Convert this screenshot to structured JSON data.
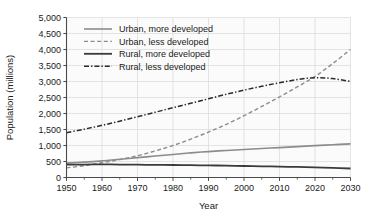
{
  "chart_data": {
    "type": "line",
    "title": "",
    "xlabel": "Year",
    "ylabel": "Population (millions)",
    "xlim": [
      1950,
      2030
    ],
    "ylim": [
      0,
      5000
    ],
    "xticks": [
      1950,
      1960,
      1970,
      1980,
      1990,
      2000,
      2010,
      2020,
      2030
    ],
    "xticklabels": [
      "1950",
      "1960",
      "1970",
      "1980",
      "1990",
      "2000",
      "2010",
      "2020",
      "2030"
    ],
    "xminor_step": 5,
    "yticks": [
      0,
      500,
      1000,
      1500,
      2000,
      2500,
      3000,
      3500,
      4000,
      4500,
      5000
    ],
    "yticklabels": [
      "0",
      "500",
      "1,000",
      "1,500",
      "2,000",
      "2,500",
      "3,000",
      "3,500",
      "4,000",
      "4,500",
      "5,000"
    ],
    "grid": true,
    "legend_position": "upper-left-inside",
    "x": [
      1950,
      1955,
      1960,
      1965,
      1970,
      1975,
      1980,
      1985,
      1990,
      1995,
      2000,
      2005,
      2010,
      2015,
      2020,
      2025,
      2030
    ],
    "series": [
      {
        "name": "Urban, more developed",
        "style": "solid",
        "color": "#8c8c8c",
        "width": 1.6,
        "values": [
          450,
          480,
          520,
          570,
          620,
          670,
          720,
          770,
          810,
          845,
          875,
          905,
          935,
          965,
          995,
          1025,
          1050
        ]
      },
      {
        "name": "Urban, less developed",
        "style": "dashed",
        "color": "#8c8c8c",
        "width": 1.4,
        "values": [
          300,
          370,
          460,
          560,
          680,
          830,
          1000,
          1200,
          1420,
          1660,
          1930,
          2220,
          2520,
          2830,
          3160,
          3560,
          4000
        ]
      },
      {
        "name": "Rural, more developed",
        "style": "solid",
        "color": "#3a3a3a",
        "width": 1.8,
        "values": [
          400,
          405,
          408,
          405,
          400,
          395,
          390,
          385,
          378,
          370,
          360,
          350,
          340,
          330,
          318,
          300,
          282
        ]
      },
      {
        "name": "Rural, less developed",
        "style": "dashdot",
        "color": "#2b2b2b",
        "width": 1.5,
        "values": [
          1400,
          1510,
          1630,
          1760,
          1900,
          2040,
          2180,
          2320,
          2460,
          2600,
          2730,
          2850,
          2960,
          3060,
          3120,
          3090,
          3000
        ]
      }
    ],
    "legend_entries": [
      {
        "label": "Urban, more developed",
        "style": "solid",
        "color": "#8c8c8c",
        "width": 1.6
      },
      {
        "label": "Urban, less developed",
        "style": "dashed",
        "color": "#8c8c8c",
        "width": 1.4
      },
      {
        "label": "Rural, more developed",
        "style": "solid",
        "color": "#3a3a3a",
        "width": 1.8
      },
      {
        "label": "Rural, less developed",
        "style": "dashdot",
        "color": "#2b2b2b",
        "width": 1.5
      }
    ],
    "colors": {
      "background": "#ffffff",
      "plot_background": "#fbfbfb",
      "grid": "#d8d8d8",
      "axis": "#4a4a4a",
      "text": "#1a1a1a"
    }
  }
}
